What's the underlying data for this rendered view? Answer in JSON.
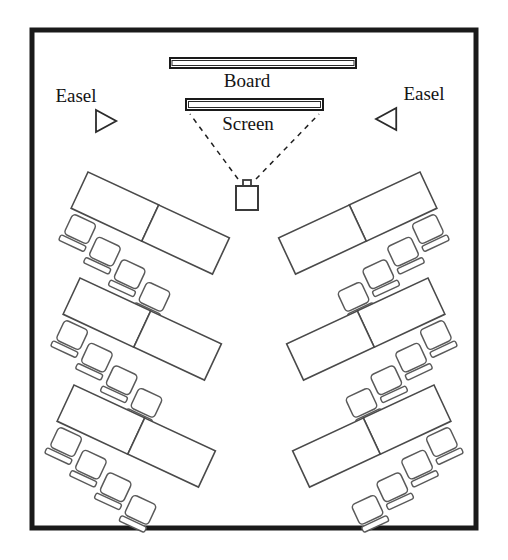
{
  "diagram": {
    "type": "floor-plan",
    "background_color": "#ffffff",
    "line_color": "#1a1a1a"
  },
  "room": {
    "x": 32,
    "y": 30,
    "width": 444,
    "height": 498,
    "stroke_width": 5
  },
  "labels": {
    "board": "Board",
    "screen": "Screen",
    "easel_left": "Easel",
    "easel_right": "Easel"
  },
  "fixtures": {
    "board": {
      "x": 170,
      "y": 58,
      "width": 186,
      "height": 10
    },
    "screen": {
      "x": 186,
      "y": 99,
      "width": 137,
      "height": 11
    },
    "projector": {
      "x": 236,
      "y": 186,
      "width": 22,
      "height": 24,
      "lens_width": 8,
      "lens_height": 6
    },
    "beam_lines": 2,
    "easel_left": {
      "x": 96,
      "y": 110,
      "size": 22,
      "direction": "right"
    },
    "easel_right": {
      "x": 376,
      "y": 108,
      "size": 22,
      "direction": "left"
    }
  },
  "label_positions": {
    "board": {
      "x": 247,
      "y": 87
    },
    "screen": {
      "x": 248,
      "y": 130
    },
    "easel_left": {
      "x": 76,
      "y": 102
    },
    "easel_right": {
      "x": 424,
      "y": 100
    }
  },
  "table_groups": [
    {
      "id": "left-front",
      "side": "left",
      "row": 1,
      "x": 88,
      "y": 172,
      "rotation": 25,
      "tables": 2,
      "chairs": 4
    },
    {
      "id": "left-middle",
      "side": "left",
      "row": 2,
      "x": 80,
      "y": 278,
      "rotation": 25,
      "tables": 2,
      "chairs": 4
    },
    {
      "id": "left-back",
      "side": "left",
      "row": 3,
      "x": 74,
      "y": 385,
      "rotation": 25,
      "tables": 2,
      "chairs": 4
    },
    {
      "id": "right-front",
      "side": "right",
      "row": 1,
      "x": 420,
      "y": 172,
      "rotation": -25,
      "tables": 2,
      "chairs": 4
    },
    {
      "id": "right-middle",
      "side": "right",
      "row": 2,
      "x": 428,
      "y": 278,
      "rotation": -25,
      "tables": 2,
      "chairs": 4
    },
    {
      "id": "right-back",
      "side": "right",
      "row": 3,
      "x": 434,
      "y": 385,
      "rotation": -25,
      "tables": 2,
      "chairs": 4
    }
  ],
  "group_geometry": {
    "table_width": 78,
    "table_height": 40,
    "chair_size": 26,
    "chair_back_height": 6,
    "chair_gap": 6
  },
  "counts": {
    "table_groups": 6,
    "tables_total": 12,
    "chairs_total": 24,
    "easels": 2,
    "boards": 1,
    "screens": 1,
    "projectors": 1
  }
}
